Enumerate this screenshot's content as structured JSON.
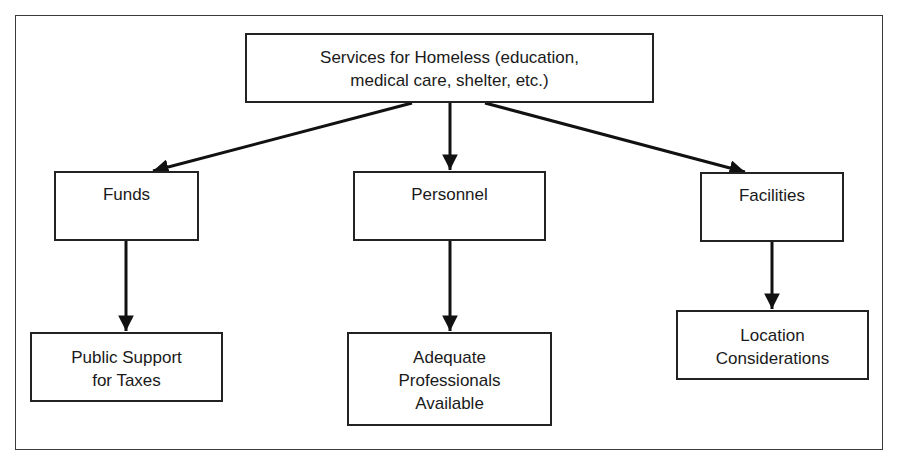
{
  "diagram": {
    "root": {
      "id": "services",
      "lines": [
        "Services for Homeless (education,",
        "medical care, shelter, etc.)"
      ]
    },
    "branches": [
      {
        "id": "funds",
        "label": "Funds",
        "child": {
          "id": "public-support",
          "lines": [
            "Public Support",
            "for Taxes"
          ]
        }
      },
      {
        "id": "personnel",
        "label": "Personnel",
        "child": {
          "id": "adequate-professionals",
          "lines": [
            "Adequate",
            "Professionals",
            "Available"
          ]
        }
      },
      {
        "id": "facilities",
        "label": "Facilities",
        "child": {
          "id": "location-considerations",
          "lines": [
            "Location",
            "Considerations"
          ]
        }
      }
    ],
    "edges": [
      {
        "from": "services",
        "to": "funds"
      },
      {
        "from": "services",
        "to": "personnel"
      },
      {
        "from": "services",
        "to": "facilities"
      },
      {
        "from": "funds",
        "to": "public-support"
      },
      {
        "from": "personnel",
        "to": "adequate-professionals"
      },
      {
        "from": "facilities",
        "to": "location-considerations"
      }
    ]
  }
}
